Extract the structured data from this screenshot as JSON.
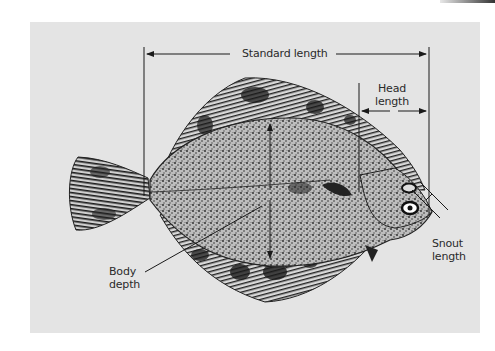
{
  "figure": {
    "labels": {
      "standard_length": "Standard length",
      "head_length_line1": "Head",
      "head_length_line2": "length",
      "snout_length_line1": "Snout",
      "snout_length_line2": "length",
      "body_depth_line1": "Body",
      "body_depth_line2": "depth"
    },
    "colors": {
      "panel": "#e4e4e4",
      "ink": "#1a1a1a",
      "background": "#ffffff"
    }
  }
}
